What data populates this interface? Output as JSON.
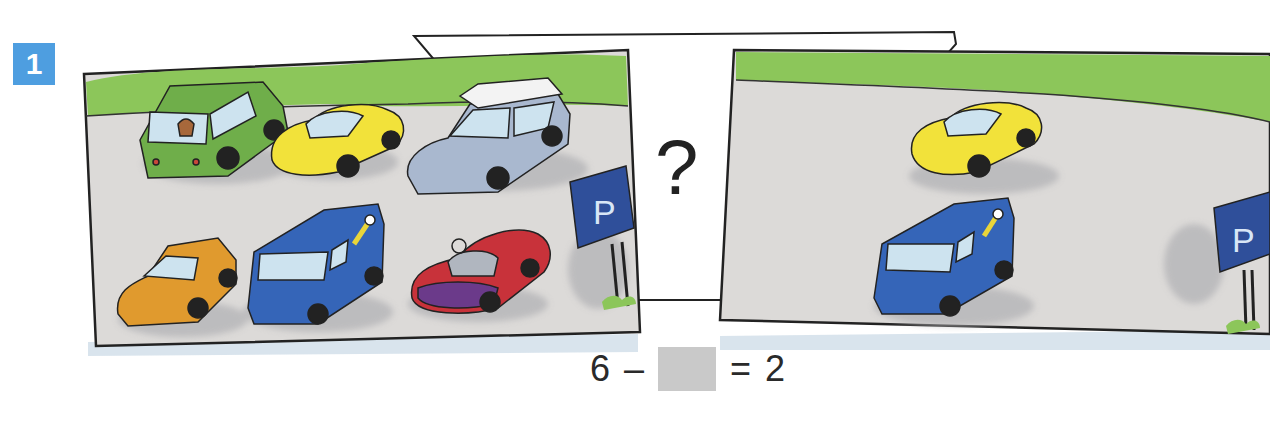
{
  "exercise": {
    "number": "1"
  },
  "left_scene": {
    "description": "parking lot before",
    "car_count": 6,
    "cars": [
      {
        "type": "hatchback-with-dog",
        "color": "#6fae4a"
      },
      {
        "type": "beetle",
        "color": "#f2e23a"
      },
      {
        "type": "station-wagon-with-roof-box",
        "color": "#a9b8cf"
      },
      {
        "type": "sedan",
        "color": "#e09a2e"
      },
      {
        "type": "van-with-wrench-logo",
        "color": "#3565b8"
      },
      {
        "type": "convertible-sports-car",
        "color": "#c8323a"
      }
    ],
    "sign_label": "P"
  },
  "question_card": {
    "symbol": "?"
  },
  "right_scene": {
    "description": "parking lot after",
    "car_count": 2,
    "cars": [
      {
        "type": "beetle",
        "color": "#f2e23a"
      },
      {
        "type": "van-with-wrench-logo",
        "color": "#3565b8"
      }
    ],
    "sign_label": "P"
  },
  "equation": {
    "minuend": "6",
    "operator": "–",
    "subtrahend_blank": "",
    "equals": "=",
    "result": "2"
  },
  "colors": {
    "badge": "#4e9ee0",
    "hedge": "#8cc65a",
    "asphalt": "#dcdad8",
    "sign": "#2f4f9a",
    "blank": "#c9c9c9"
  }
}
